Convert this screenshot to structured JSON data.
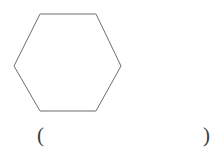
{
  "page": {
    "background_color": "#ffffff",
    "width": 218,
    "height": 156
  },
  "figure": {
    "name": "hexagon",
    "shape_label": "hexagon",
    "sides": 6,
    "orientation": "flat-top",
    "stroke_color": "#6e6e6e",
    "fill_color": "#ffffff",
    "stroke_width": 1,
    "points": "40,14 96,14 121,66 96,111 40,111 14,66",
    "vertices": [
      {
        "label": "top-left",
        "x": 40,
        "y": 14
      },
      {
        "label": "top-right",
        "x": 96,
        "y": 14
      },
      {
        "label": "right",
        "x": 121,
        "y": 66
      },
      {
        "label": "bottom-right",
        "x": 96,
        "y": 111
      },
      {
        "label": "bottom-left",
        "x": 40,
        "y": 111
      },
      {
        "label": "left",
        "x": 14,
        "y": 66
      }
    ]
  },
  "answer": {
    "open_paren": "(",
    "close_paren": ")",
    "value": "",
    "placeholder": ""
  }
}
